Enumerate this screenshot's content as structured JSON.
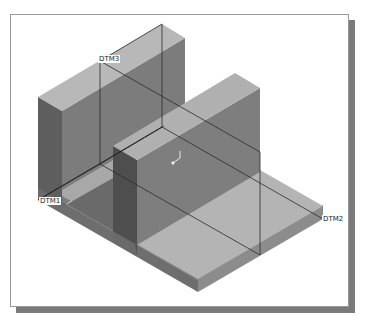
{
  "viewport": {
    "title": "3D part model isometric view",
    "background": "#ffffff",
    "shadow_color": "#7a7a7a"
  },
  "datums": [
    {
      "name": "DTM1",
      "label": "DTM1"
    },
    {
      "name": "DTM2",
      "label": "DTM2"
    },
    {
      "name": "DTM3",
      "label": "DTM3"
    }
  ],
  "colors": {
    "top_face": "#b4b4b4",
    "left_face": "#6e6e6e",
    "right_face": "#8c8c8c",
    "edge": "#2a2a2a"
  },
  "coordinate_system_icon": "csys-icon"
}
